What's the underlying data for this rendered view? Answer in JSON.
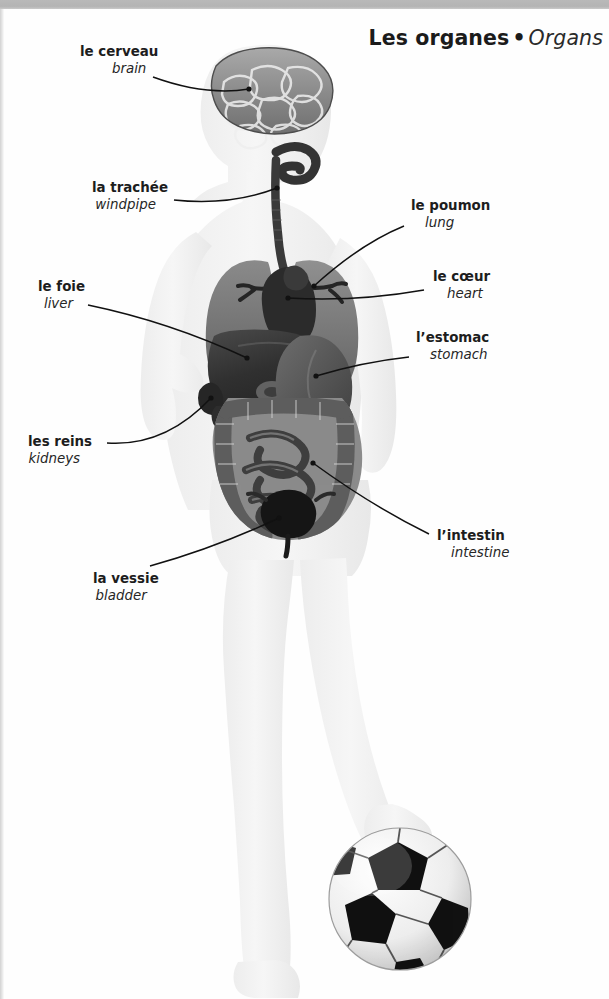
{
  "page": {
    "title_fr": "Les organes",
    "title_separator": "•",
    "title_en": "Organs",
    "background_color": "#fefefe",
    "text_color": "#1d1d1d"
  },
  "labels": [
    {
      "id": "brain",
      "fr": "le cerveau",
      "en": "brain",
      "side": "left",
      "x": 80,
      "y": 44,
      "leader": {
        "from_x": 153,
        "from_y": 77,
        "to_x": 249,
        "to_y": 89
      }
    },
    {
      "id": "trachea",
      "fr": "la trachée",
      "en": "windpipe",
      "side": "left",
      "x": 92,
      "y": 180,
      "leader": {
        "from_x": 174,
        "from_y": 200,
        "to_x": 277,
        "to_y": 188
      }
    },
    {
      "id": "liver",
      "fr": "le foie",
      "en": "liver",
      "side": "left",
      "x": 38,
      "y": 279,
      "leader": {
        "from_x": 88,
        "from_y": 305,
        "to_x": 247,
        "to_y": 358
      }
    },
    {
      "id": "kidneys",
      "fr": "les reins",
      "en": "kidneys",
      "side": "left",
      "x": 28,
      "y": 434,
      "leader": {
        "from_x": 107,
        "from_y": 443,
        "to_x": 211,
        "to_y": 398
      }
    },
    {
      "id": "bladder",
      "fr": "la vessie",
      "en": "bladder",
      "side": "left",
      "x": 93,
      "y": 571,
      "leader": {
        "from_x": 150,
        "from_y": 566,
        "to_x": 279,
        "to_y": 518
      }
    },
    {
      "id": "lung",
      "fr": "le poumon",
      "en": "lung",
      "side": "right",
      "x": 411,
      "y": 198,
      "leader": {
        "from_x": 404,
        "from_y": 226,
        "to_x": 314,
        "to_y": 286
      }
    },
    {
      "id": "heart",
      "fr": "le cœur",
      "en": "heart",
      "side": "right",
      "x": 433,
      "y": 269,
      "leader": {
        "from_x": 424,
        "from_y": 290,
        "to_x": 288,
        "to_y": 298
      }
    },
    {
      "id": "stomach",
      "fr": "l’estomac",
      "en": "stomach",
      "side": "right",
      "x": 416,
      "y": 330,
      "leader": {
        "from_x": 409,
        "from_y": 357,
        "to_x": 316,
        "to_y": 376
      }
    },
    {
      "id": "intestine",
      "fr": "l’intestin",
      "en": "intestine",
      "side": "right",
      "x": 437,
      "y": 528,
      "leader": {
        "from_x": 429,
        "from_y": 534,
        "to_x": 313,
        "to_y": 463
      }
    }
  ],
  "illustration": {
    "subject": "child-body-silhouette-with-organs",
    "body_color": "#f2f2f2",
    "organ_colors": {
      "brain": "#8d8d8d",
      "trachea": "#3a3a3a",
      "lung": "#6f6f6f",
      "heart": "#2e2e2e",
      "liver": "#343434",
      "stomach": "#555555",
      "intestine": "#7a7a7a",
      "kidney": "#2b2b2b",
      "bladder": "#1f1f1f"
    },
    "ball": {
      "name": "soccer-ball",
      "panel_dark": "#111111",
      "panel_light": "#f4f4f4",
      "center_x": 400,
      "center_y": 899,
      "radius": 71
    }
  }
}
